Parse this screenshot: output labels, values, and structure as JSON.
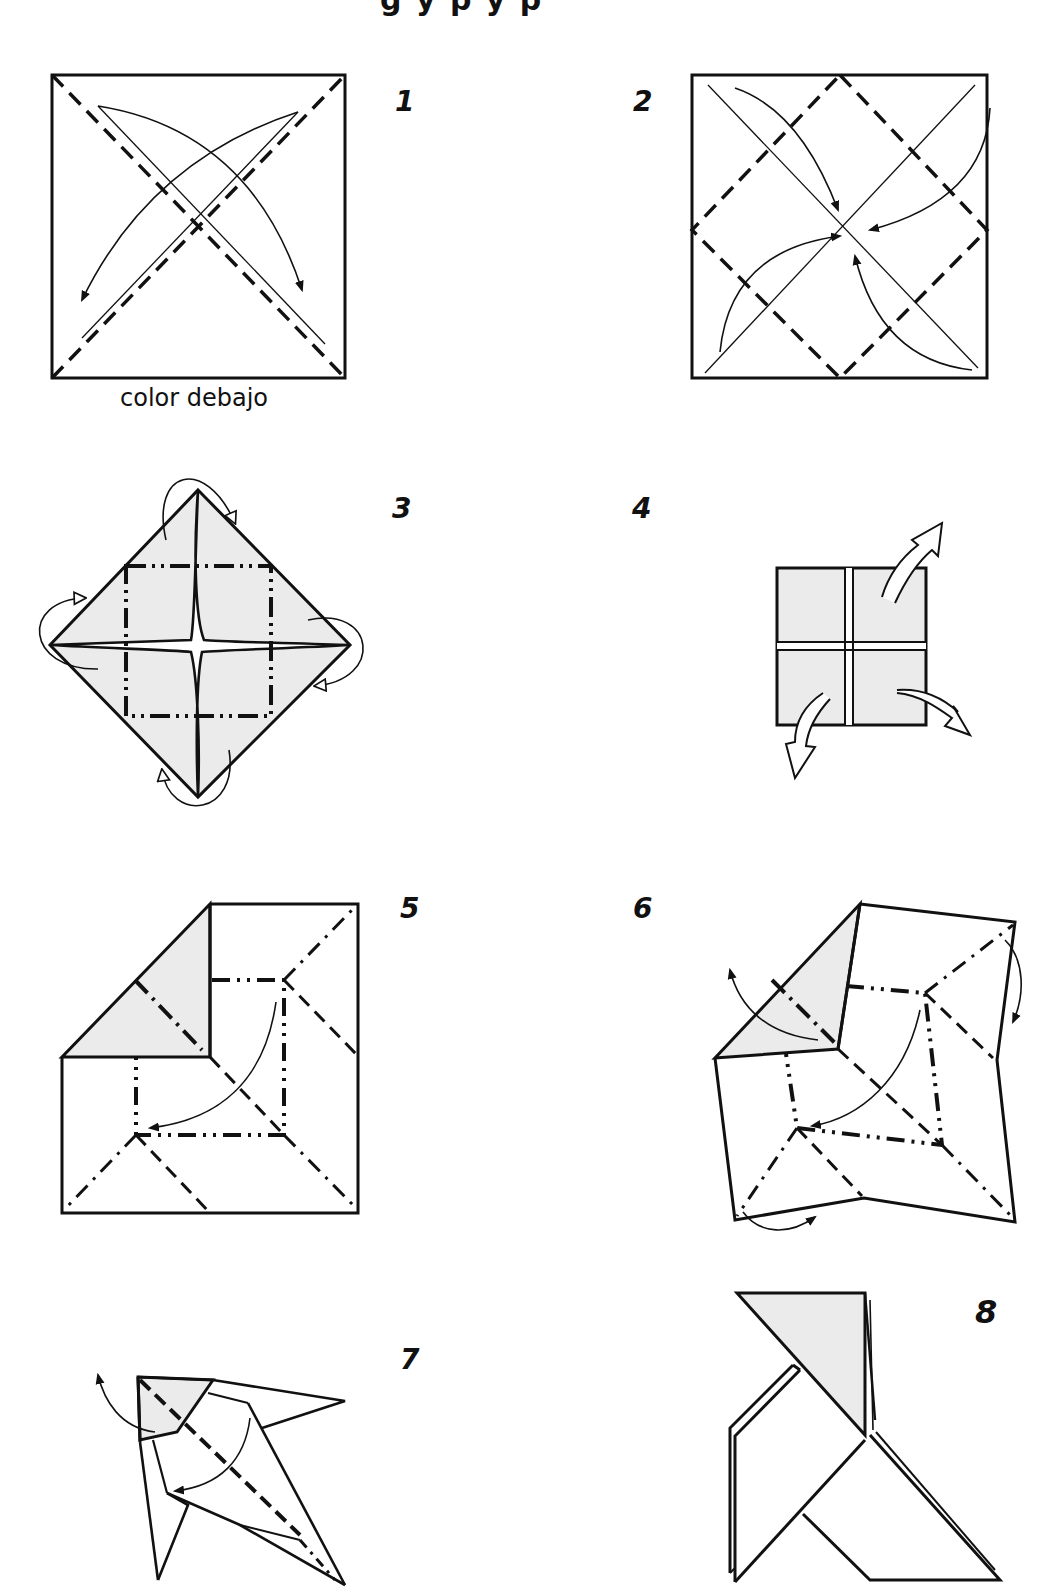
{
  "page": {
    "title_fragment": "g    y  p     y  p",
    "colors": {
      "ink": "#111111",
      "paper": "#ffffff",
      "shade": "#ebebeb"
    }
  },
  "steps": [
    {
      "number": "1",
      "caption": "color debajo"
    },
    {
      "number": "2"
    },
    {
      "number": "3"
    },
    {
      "number": "4"
    },
    {
      "number": "5"
    },
    {
      "number": "6"
    },
    {
      "number": "7"
    },
    {
      "number": "8"
    }
  ]
}
